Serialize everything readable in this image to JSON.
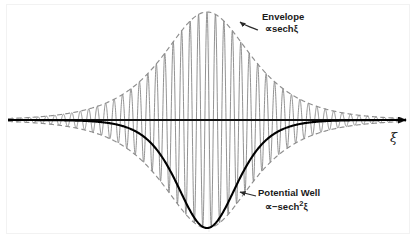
{
  "figure": {
    "background_color": "#ffffff"
  },
  "axis": {
    "label": "ξ",
    "name": "xi-axis",
    "color": "#000000",
    "y_pixel": 120,
    "x_start": 8,
    "x_end": 410,
    "arrow": "right"
  },
  "annotations": [
    {
      "name": "envelope",
      "label": "Envelope",
      "formula": "∝ sechξ",
      "formula_parts": {
        "proportional": "∝",
        "func": "sech",
        "arg": "ξ"
      },
      "pointer": "curved-arrow-down-left",
      "color": "#1a1a1a"
    },
    {
      "name": "potential-well",
      "label": "Potential Well",
      "formula": "∝−sech²ξ",
      "formula_parts": {
        "proportional": "∝−",
        "func": "sech",
        "exponent": "2",
        "arg": "ξ"
      },
      "pointer": "arrow-left",
      "color": "#1a1a1a"
    }
  ],
  "chart_data": {
    "type": "line",
    "title": "",
    "xlabel": "ξ",
    "ylabel": "",
    "grid": false,
    "legend": "none",
    "xlim": [
      -5.0,
      5.0
    ],
    "ylim": [
      -2.05,
      1.05
    ],
    "series": [
      {
        "name": "carrier",
        "description": "rapidly oscillating carrier wave sech(ξ)·cos(kξ) filling the envelope",
        "color": "#808080",
        "style": "solid",
        "width": 0.9,
        "formula": "sech(ξ) cos(kξ)",
        "carrier_wavenumber": 29.6,
        "amplitude_peak": 1.0,
        "peak_x": 0.0
      },
      {
        "name": "envelope-upper",
        "description": "upper envelope of the wave packet",
        "color": "#8a8a8a",
        "style": "dashed",
        "dash": "5,3",
        "width": 1.1,
        "formula": "+sech(ξ)",
        "peak_value": 1.0,
        "peak_x": 0.0
      },
      {
        "name": "envelope-lower",
        "description": "lower envelope of the wave packet",
        "color": "#8a8a8a",
        "style": "dashed",
        "dash": "5,3",
        "width": 1.1,
        "formula": "-sech(ξ)",
        "peak_value": -1.0,
        "peak_x": 0.0
      },
      {
        "name": "potential-well",
        "description": "self-induced potential well, negative squared hyperbolic secant",
        "color": "#000000",
        "style": "solid",
        "width": 2.0,
        "formula": "-sech²(ξ)",
        "minimum_value": -1.0,
        "minimum_x": 0.0
      }
    ]
  }
}
